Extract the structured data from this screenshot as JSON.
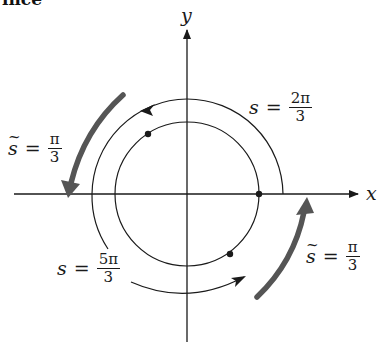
{
  "header": {
    "cropped_text": "ince"
  },
  "axes": {
    "x_label": "x",
    "y_label": "y",
    "origin": [
      187,
      194
    ]
  },
  "circles": {
    "inner_radius": 72,
    "outer_radius": 95
  },
  "points": [
    {
      "name": "point-s-0",
      "angle": "0"
    },
    {
      "name": "point-s-2pi-3",
      "angle": "2π/3"
    },
    {
      "name": "point-s-5pi-3",
      "angle": "5π/3"
    }
  ],
  "labels": {
    "s_2pi3": {
      "var": "s",
      "op": "=",
      "num": "2π",
      "den": "3"
    },
    "s_5pi3": {
      "var": "s",
      "op": "=",
      "num": "5π",
      "den": "3"
    },
    "stilde_upper": {
      "var": "s",
      "tilde": "~",
      "op": "=",
      "num": "π",
      "den": "3"
    },
    "stilde_lower": {
      "var": "s",
      "tilde": "~",
      "op": "=",
      "num": "π",
      "den": "3"
    }
  },
  "colors": {
    "ink": "#1a1a1a",
    "thick_arrow": "#555555",
    "background": "#ffffff"
  }
}
